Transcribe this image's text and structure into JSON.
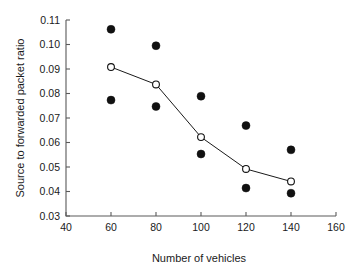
{
  "chart_data": {
    "type": "scatter",
    "title": "",
    "xlabel": "Number of vehicles",
    "ylabel": "Source to forwarded packet ratio",
    "xlim": [
      40,
      160
    ],
    "ylim": [
      0.03,
      0.11
    ],
    "xticks": [
      40,
      60,
      80,
      100,
      120,
      140,
      160
    ],
    "xtick_labels": [
      "40",
      "60",
      "80",
      "100",
      "120",
      "140",
      "160"
    ],
    "yticks": [
      0.03,
      0.04,
      0.05,
      0.06,
      0.07,
      0.08,
      0.09,
      0.1,
      0.11
    ],
    "ytick_labels": [
      "0.03",
      "0.04",
      "0.05",
      "0.06",
      "0.07",
      "0.08",
      "0.09",
      "0.10",
      "0.11"
    ],
    "grid": false,
    "legend": "none",
    "x": [
      60,
      80,
      100,
      120,
      140
    ],
    "series": [
      {
        "name": "mean",
        "marker": "open-circle",
        "line": true,
        "values": [
          0.0908,
          0.0837,
          0.0622,
          0.0492,
          0.0441
        ]
      },
      {
        "name": "upper",
        "marker": "filled-circle",
        "line": false,
        "values": [
          0.1062,
          0.0995,
          0.0789,
          0.0669,
          0.057
        ]
      },
      {
        "name": "lower",
        "marker": "filled-circle",
        "line": false,
        "values": [
          0.0773,
          0.0747,
          0.0553,
          0.0414,
          0.0393
        ]
      }
    ],
    "colors": {
      "line": "#111111",
      "filled_marker": "#111111",
      "open_marker_fill": "#ffffff",
      "axis": "#5a5a5a",
      "background": "#ffffff"
    }
  }
}
